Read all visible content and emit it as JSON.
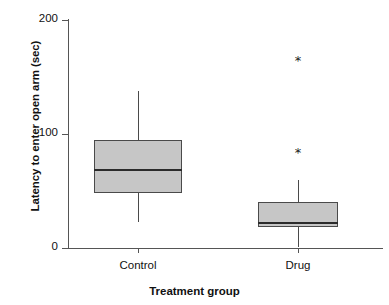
{
  "chart_data": {
    "type": "box",
    "title": "",
    "xlabel": "Treatment group",
    "ylabel": "Latency to enter open arm (sec)",
    "categories": [
      "Control",
      "Drug"
    ],
    "ylim": [
      0,
      200
    ],
    "yticks": [
      0,
      100,
      200
    ],
    "ytick_labels": [
      "0",
      "100",
      "200"
    ],
    "grid": false,
    "legend": false,
    "series": [
      {
        "name": "Control",
        "min": 23,
        "q1": 48,
        "median": 68,
        "q3": 95,
        "max": 138,
        "outliers": []
      },
      {
        "name": "Drug",
        "min": 1,
        "q1": 18,
        "median": 22,
        "q3": 40,
        "max": 60,
        "outliers": [
          86,
          167
        ]
      }
    ],
    "colors": {
      "box_fill": "#c6c6c6",
      "box_stroke": "#4a4a4a",
      "median": "#2b2b2b",
      "axis": "#555555",
      "text": "#111111"
    },
    "outlier_marker": "*"
  }
}
